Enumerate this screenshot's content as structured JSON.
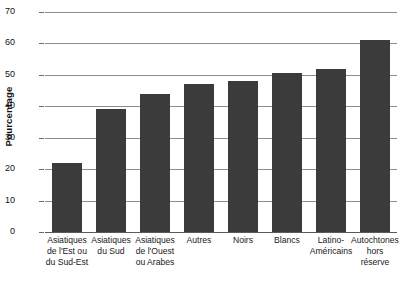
{
  "chart_data": {
    "type": "bar",
    "title": "",
    "xlabel": "",
    "ylabel": "Pourcentage",
    "ylim": [
      0,
      70
    ],
    "ytick_step": 10,
    "yticks": [
      0,
      10,
      20,
      30,
      40,
      50,
      60,
      70
    ],
    "grid": true,
    "legend": false,
    "bar_color": "#3b3b3b",
    "categories": [
      "Asiatiques de l'Est ou du Sud-Est",
      "Asiatiques du Sud",
      "Asiatiques de l'Ouest ou Arabes",
      "Autres",
      "Noirs",
      "Blancs",
      "Latino-Américains",
      "Autochtones hors réserve"
    ],
    "category_lines": [
      [
        "Asiatiques",
        "de l'Est ou",
        "du Sud-Est"
      ],
      [
        "Asiatiques",
        "du Sud"
      ],
      [
        "Asiatiques",
        "de l'Ouest",
        "ou Arabes"
      ],
      [
        "Autres"
      ],
      [
        "Noirs"
      ],
      [
        "Blancs"
      ],
      [
        "Latino-",
        "Américains"
      ],
      [
        "Autochtones",
        "hors",
        "réserve"
      ]
    ],
    "values": [
      22,
      39,
      44,
      47,
      48,
      50.5,
      52,
      61
    ]
  },
  "axis": {
    "y_title": "Pourcentage",
    "tick_labels": [
      "70",
      "60",
      "50",
      "40",
      "30",
      "20",
      "10",
      "0"
    ]
  },
  "caption": {
    "partial_text": "Origine ethnique"
  }
}
